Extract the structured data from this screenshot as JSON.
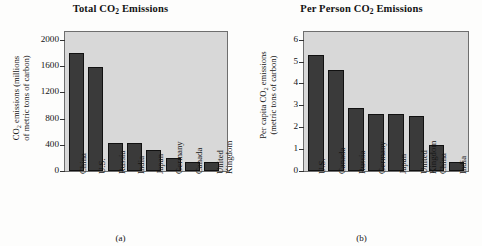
{
  "figure": {
    "background": "#fdfdfc",
    "panel_count": 2
  },
  "panels": [
    {
      "caption": "(a)",
      "title_pre": "Total CO",
      "title_sub": "2",
      "title_post": " Emissions",
      "ylabel_line1_pre": "CO",
      "ylabel_line1_sub": "2",
      "ylabel_line1_post": " emissions (millions",
      "ylabel_line2": "of metric tons of carbon)"
    },
    {
      "caption": "(b)",
      "title_pre": "Per Person CO",
      "title_sub": "2",
      "title_post": " Emissions",
      "ylabel_line1_pre": "Per capita CO",
      "ylabel_line1_sub": "2",
      "ylabel_line1_post": " emissions",
      "ylabel_line2": "(metric tons of carbon)"
    }
  ],
  "chart_data": [
    {
      "type": "bar",
      "panel": "(a)",
      "title": "Total CO2 Emissions",
      "xlabel": "",
      "ylabel": "CO2 emissions (millions of metric tons of carbon)",
      "ylim": [
        0,
        2120
      ],
      "yticks": [
        0,
        400,
        800,
        1200,
        1600,
        2000
      ],
      "ytick_labels": [
        "0",
        "400",
        "800",
        "1200",
        "1600",
        "2000"
      ],
      "grid": false,
      "legend": null,
      "bar_color": "#3a3a3a",
      "plot_background": "#d8d8d8",
      "categories": [
        "China",
        "U.S.",
        "Russia",
        "India",
        "Japan",
        "Germany",
        "Canada",
        "United Kingdom"
      ],
      "category_lines": [
        [
          "China"
        ],
        [
          "U.S."
        ],
        [
          "Russia"
        ],
        [
          "India"
        ],
        [
          "Japan"
        ],
        [
          "Germany"
        ],
        [
          "Canada"
        ],
        [
          "United",
          "Kingdom"
        ]
      ],
      "values": [
        1800,
        1580,
        430,
        425,
        320,
        200,
        135,
        135
      ]
    },
    {
      "type": "bar",
      "panel": "(b)",
      "title": "Per Person CO2 Emissions",
      "xlabel": "",
      "ylabel": "Per capita CO2 emissions (metric tons of carbon)",
      "ylim": [
        0,
        6.35
      ],
      "yticks": [
        0,
        1,
        2,
        3,
        4,
        5,
        6
      ],
      "ytick_labels": [
        "0",
        "1",
        "2",
        "3",
        "4",
        "5",
        "6"
      ],
      "grid": false,
      "legend": null,
      "bar_color": "#3a3a3a",
      "plot_background": "#d8d8d8",
      "categories": [
        "U.S.",
        "Canada",
        "Russia",
        "Germany",
        "Japan",
        "United Kingdom",
        "China",
        "India"
      ],
      "category_lines": [
        [
          "U.S."
        ],
        [
          "Canada"
        ],
        [
          "Russia"
        ],
        [
          "Germany"
        ],
        [
          "Japan"
        ],
        [
          "United",
          "Kingdom"
        ],
        [
          "China"
        ],
        [
          "India"
        ]
      ],
      "values": [
        5.3,
        4.6,
        2.9,
        2.6,
        2.6,
        2.5,
        1.2,
        0.4
      ]
    }
  ]
}
